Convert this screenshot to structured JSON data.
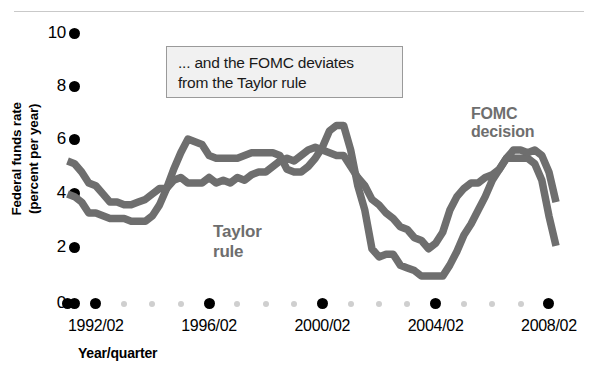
{
  "chart_data": {
    "type": "line",
    "title": "",
    "xlabel": "Year/quarter",
    "ylabel": "Federal funds rate (percent per year)",
    "ylim": [
      0,
      10
    ],
    "yticks": [
      0,
      2,
      4,
      6,
      8,
      10
    ],
    "ytick_labels": [
      "0",
      "2",
      "4",
      "6",
      "8",
      "10"
    ],
    "xtick_labels": [
      "1992/02",
      "1996/02",
      "2000/02",
      "2004/02",
      "2008/02"
    ],
    "x_start": "1991/01",
    "x_end": "2008/02",
    "grid": false,
    "legend_position": "inline-annotations",
    "annotation": "... and the FOMC deviates from the Taylor rule",
    "series": [
      {
        "name": "FOMC decision",
        "color": "#6e6e6e",
        "x": [
          "1991/01",
          "1991/02",
          "1991/03",
          "1991/04",
          "1992/01",
          "1992/02",
          "1992/03",
          "1992/04",
          "1993/01",
          "1993/02",
          "1993/03",
          "1993/04",
          "1994/01",
          "1994/02",
          "1994/03",
          "1994/04",
          "1995/01",
          "1995/02",
          "1995/03",
          "1995/04",
          "1996/01",
          "1996/02",
          "1996/03",
          "1996/04",
          "1997/01",
          "1997/02",
          "1997/03",
          "1997/04",
          "1998/01",
          "1998/02",
          "1998/03",
          "1998/04",
          "1999/01",
          "1999/02",
          "1999/03",
          "1999/04",
          "2000/01",
          "2000/02",
          "2000/03",
          "2000/04",
          "2001/01",
          "2001/02",
          "2001/03",
          "2001/04",
          "2002/01",
          "2002/02",
          "2002/03",
          "2002/04",
          "2003/01",
          "2003/02",
          "2003/03",
          "2003/04",
          "2004/01",
          "2004/02",
          "2004/03",
          "2004/04",
          "2005/01",
          "2005/02",
          "2005/03",
          "2005/04",
          "2006/01",
          "2006/02",
          "2006/03",
          "2006/04",
          "2007/01",
          "2007/02",
          "2007/03",
          "2007/04",
          "2008/01",
          "2008/02"
        ],
        "values": [
          4.0,
          3.9,
          3.7,
          3.3,
          3.3,
          3.2,
          3.1,
          3.1,
          3.1,
          3.0,
          3.0,
          3.0,
          3.2,
          3.6,
          4.2,
          4.9,
          5.5,
          6.0,
          5.9,
          5.8,
          5.4,
          5.3,
          5.3,
          5.3,
          5.3,
          5.4,
          5.5,
          5.5,
          5.5,
          5.5,
          5.4,
          4.9,
          4.8,
          4.8,
          5.0,
          5.3,
          5.7,
          6.3,
          6.5,
          6.5,
          5.6,
          4.3,
          3.4,
          2.0,
          1.7,
          1.8,
          1.8,
          1.4,
          1.3,
          1.2,
          1.0,
          1.0,
          1.0,
          1.0,
          1.4,
          1.9,
          2.5,
          2.9,
          3.4,
          3.9,
          4.5,
          4.9,
          5.3,
          5.3,
          5.3,
          5.3,
          5.1,
          4.5,
          3.2,
          2.1
        ]
      },
      {
        "name": "Taylor rule",
        "color": "#6e6e6e",
        "x": [
          "1991/01",
          "1991/02",
          "1991/03",
          "1991/04",
          "1992/01",
          "1992/02",
          "1992/03",
          "1992/04",
          "1993/01",
          "1993/02",
          "1993/03",
          "1993/04",
          "1994/01",
          "1994/02",
          "1994/03",
          "1994/04",
          "1995/01",
          "1995/02",
          "1995/03",
          "1995/04",
          "1996/01",
          "1996/02",
          "1996/03",
          "1996/04",
          "1997/01",
          "1997/02",
          "1997/03",
          "1997/04",
          "1998/01",
          "1998/02",
          "1998/03",
          "1998/04",
          "1999/01",
          "1999/02",
          "1999/03",
          "1999/04",
          "2000/01",
          "2000/02",
          "2000/03",
          "2000/04",
          "2001/01",
          "2001/02",
          "2001/03",
          "2001/04",
          "2002/01",
          "2002/02",
          "2002/03",
          "2002/04",
          "2003/01",
          "2003/02",
          "2003/03",
          "2003/04",
          "2004/01",
          "2004/02",
          "2004/03",
          "2004/04",
          "2005/01",
          "2005/02",
          "2005/03",
          "2005/04",
          "2006/01",
          "2006/02",
          "2006/03",
          "2006/04",
          "2007/01",
          "2007/02",
          "2007/03",
          "2007/04",
          "2008/01",
          "2008/02"
        ],
        "values": [
          5.2,
          5.1,
          4.8,
          4.4,
          4.3,
          4.0,
          3.7,
          3.7,
          3.6,
          3.6,
          3.7,
          3.8,
          4.0,
          4.2,
          4.2,
          4.5,
          4.6,
          4.4,
          4.4,
          4.4,
          4.6,
          4.4,
          4.5,
          4.4,
          4.6,
          4.5,
          4.7,
          4.8,
          4.8,
          5.0,
          5.2,
          5.3,
          5.2,
          5.4,
          5.6,
          5.7,
          5.6,
          5.5,
          5.4,
          5.4,
          5.0,
          4.6,
          4.3,
          3.8,
          3.6,
          3.3,
          3.1,
          2.8,
          2.7,
          2.4,
          2.3,
          2.0,
          2.2,
          2.6,
          3.4,
          3.9,
          4.2,
          4.4,
          4.4,
          4.6,
          4.7,
          4.9,
          5.3,
          5.6,
          5.6,
          5.5,
          5.6,
          5.4,
          4.8,
          3.7
        ]
      }
    ]
  },
  "axes": {
    "y_title": "Federal funds rate\n(percent per year)",
    "y_title_line1": "Federal funds rate",
    "y_title_line2": "(percent per year)",
    "x_title": "Year/quarter",
    "y_labels": [
      "10",
      "8",
      "6",
      "4",
      "2",
      "0"
    ],
    "x_labels": [
      "1992/02",
      "1996/02",
      "2000/02",
      "2004/02",
      "2008/02"
    ]
  },
  "annotation_box": {
    "line1": "... and the FOMC deviates",
    "line2": "from the Taylor rule"
  },
  "series_labels": {
    "taylor_line1": "Taylor",
    "taylor_line2": "rule",
    "fomc_line1": "FOMC",
    "fomc_line2": "decision"
  },
  "colors": {
    "line": "#6e6e6e",
    "tick_major": "#000000",
    "tick_minor": "#cfcfcf",
    "annotation_bg": "#f1f1f1",
    "annotation_border": "#9a9a9a"
  }
}
